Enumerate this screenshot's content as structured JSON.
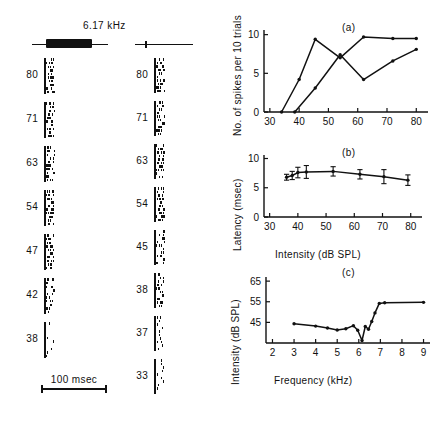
{
  "figure": {
    "stimulus_frequency_label": "6.17 kHz",
    "scale_bar_label": "100 msec",
    "stimuli": [
      {
        "name": "tone-burst",
        "type": "long-tone-burst"
      },
      {
        "name": "click",
        "type": "brief-click"
      }
    ]
  },
  "raster": {
    "left": {
      "name": "tone-burst-raster",
      "levels": [
        "80",
        "71",
        "63",
        "54",
        "47",
        "42",
        "38"
      ]
    },
    "right": {
      "name": "click-raster",
      "levels": [
        "80",
        "71",
        "63",
        "54",
        "45",
        "38",
        "37",
        "33"
      ]
    }
  },
  "chart_data": [
    {
      "id": "a",
      "type": "line",
      "tag": "(a)",
      "title": "",
      "xlabel": "",
      "ylabel": "No. of spikes per 10 trials",
      "xlim": [
        28,
        84
      ],
      "ylim": [
        0,
        10.6
      ],
      "xticks": [
        30,
        40,
        50,
        60,
        70,
        80
      ],
      "xticklabels": [
        "30",
        "40",
        "50",
        "60",
        "70",
        "80"
      ],
      "yticks": [
        0,
        5,
        10
      ],
      "yticklabels": [
        "0",
        "5",
        "10"
      ],
      "grid": false,
      "legend": "none",
      "series": [
        {
          "name": "tone-burst",
          "x": [
            34,
            40,
            45.5,
            54,
            62,
            72,
            80
          ],
          "values": [
            0,
            4.2,
            9.4,
            7.0,
            9.7,
            9.5,
            9.5
          ]
        },
        {
          "name": "click",
          "x": [
            38.5,
            45.5,
            54,
            62,
            72,
            80
          ],
          "values": [
            0,
            3.1,
            7.4,
            4.2,
            6.6,
            8.1
          ]
        }
      ]
    },
    {
      "id": "b",
      "type": "line",
      "tag": "(b)",
      "title": "",
      "xlabel": "Intensity (dB SPL)",
      "ylabel": "Latency (msec)",
      "xlim": [
        28,
        84
      ],
      "ylim": [
        0,
        10.6
      ],
      "xticks": [
        30,
        40,
        50,
        60,
        70,
        80
      ],
      "xticklabels": [
        "30",
        "40",
        "50",
        "60",
        "70",
        "80"
      ],
      "yticks": [
        0,
        5,
        10
      ],
      "yticklabels": [
        "0",
        "5",
        "10"
      ],
      "grid": false,
      "legend": "none",
      "series": [
        {
          "name": "latency-mean",
          "x": [
            36,
            38,
            40,
            43,
            52.5,
            62,
            70.5,
            79
          ],
          "values": [
            6.8,
            7.1,
            7.6,
            7.7,
            7.8,
            7.3,
            6.9,
            6.3
          ],
          "errors": [
            0.5,
            0.7,
            0.9,
            1.1,
            0.8,
            0.8,
            1.2,
            0.9
          ]
        }
      ]
    },
    {
      "id": "c",
      "type": "line",
      "tag": "(c)",
      "title": "",
      "xlabel": "Frequency (kHz)",
      "ylabel": "Intensity (dB SPL)",
      "xlim": [
        1.7,
        9.3
      ],
      "ylim": [
        35,
        67
      ],
      "xticks": [
        2,
        3,
        4,
        5,
        6,
        7,
        8,
        9
      ],
      "xticklabels": [
        "2",
        "3",
        "4",
        "5",
        "6",
        "7",
        "8",
        "9"
      ],
      "yticks": [
        45,
        55,
        65
      ],
      "yticklabels": [
        "45",
        "55",
        "65"
      ],
      "grid": false,
      "legend": "none",
      "series": [
        {
          "name": "tuning-curve",
          "x": [
            3.0,
            4.0,
            4.55,
            5.0,
            5.4,
            5.75,
            5.95,
            6.15,
            6.3,
            6.45,
            6.6,
            6.75,
            6.95,
            7.2,
            9.0
          ],
          "values": [
            44.3,
            43.2,
            42.3,
            41.3,
            41.9,
            43.4,
            41.2,
            36.2,
            43.0,
            41.7,
            45.4,
            49.6,
            54.2,
            54.5,
            54.7
          ]
        }
      ]
    }
  ]
}
